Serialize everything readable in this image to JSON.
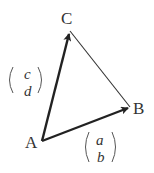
{
  "diagram": {
    "type": "vector-triangle",
    "points": {
      "A": {
        "label": "A",
        "x": 42,
        "y": 141
      },
      "B": {
        "label": "B",
        "x": 130,
        "y": 107
      },
      "C": {
        "label": "C",
        "x": 70,
        "y": 31
      }
    },
    "vectors": [
      {
        "from": "A",
        "to": "B",
        "label_top": "a",
        "label_bottom": "b",
        "bold": true
      },
      {
        "from": "A",
        "to": "C",
        "label_top": "c",
        "label_bottom": "d",
        "bold": true
      }
    ],
    "edges": [
      {
        "from": "C",
        "to": "B",
        "bold": false
      }
    ],
    "colors": {
      "line": "#222222",
      "text": "#333333"
    }
  }
}
